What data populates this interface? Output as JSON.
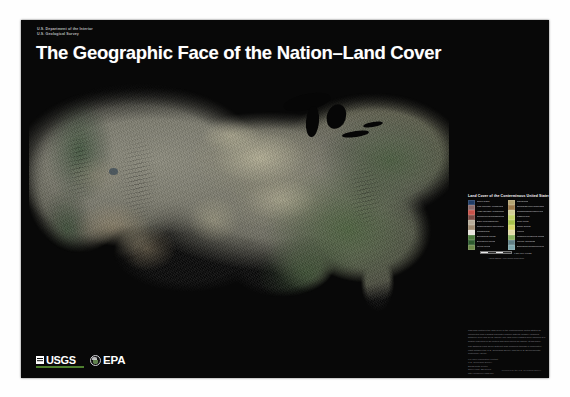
{
  "poster": {
    "agency_line_1": "U.S. Department of the Interior",
    "agency_line_2": "U.S. Geological Survey",
    "title": "The Geographic Face of the Nation–Land Cover",
    "background_color": "#080808",
    "title_color": "#ffffff",
    "credit": "Produced by the U.S. Geological Survey"
  },
  "map": {
    "name": "land-cover-map-contiguous-united-states",
    "description": "Satellite-derived land cover raster of the contiguous United States rendered on a black background",
    "features": [
      "great-lake-superior",
      "great-lake-michigan",
      "great-lake-huron",
      "great-lake-erie",
      "great-lake-ontario",
      "great-salt-lake"
    ]
  },
  "legend": {
    "title": "Land Cover of the Conterminous United States, 1992",
    "column_left": [
      {
        "label": "Open water",
        "color": "#1f3c66"
      },
      {
        "label": "Low intensity residential",
        "color": "#8a6a6a"
      },
      {
        "label": "High intensity residential",
        "color": "#c8524a"
      },
      {
        "label": "Commercial/industrial/transportation",
        "color": "#7a4a44"
      },
      {
        "label": "Bare rock/sand/clay",
        "color": "#b8ad9a"
      },
      {
        "label": "Quarries/strip mines/gravel pits",
        "color": "#a08c72"
      },
      {
        "label": "Transitional",
        "color": "#e8e4dc"
      },
      {
        "label": "Deciduous forest",
        "color": "#4c7a3c"
      },
      {
        "label": "Evergreen forest",
        "color": "#2d5a2d"
      },
      {
        "label": "Mixed forest",
        "color": "#6e8a4a"
      }
    ],
    "column_right": [
      {
        "label": "Shrubland",
        "color": "#b5a472"
      },
      {
        "label": "Orchards/vineyards/other",
        "color": "#9c7a4a"
      },
      {
        "label": "Grasslands/herbaceous",
        "color": "#d2cf96"
      },
      {
        "label": "Pasture/hay",
        "color": "#c4d36a"
      },
      {
        "label": "Row crops",
        "color": "#a8c24a"
      },
      {
        "label": "Small grains",
        "color": "#d8d86a"
      },
      {
        "label": "Fallow",
        "color": "#e2dca8"
      },
      {
        "label": "Urban/recreational grasses",
        "color": "#88b060"
      },
      {
        "label": "Woody wetlands",
        "color": "#5f7f86"
      },
      {
        "label": "Emergent herbaceous wetlands",
        "color": "#7fa8ae"
      }
    ],
    "footnote": "Albers Equal-Area Conic Projection",
    "scale_text": "0        250        500 MILES"
  },
  "description": {
    "paragraph_1": "This map portrays the land cover of the conterminous United States as interpreted from Landsat Thematic Mapper satellite imagery acquired between 1990 and 1993. Twenty-one land cover classes were mapped at a spatial resolution of 30 meters and generalized for display at this scale.",
    "paragraph_2": "The National Land Cover Data set was produced through a cooperative effort between the U.S. Geological Survey and the U.S. Environmental Protection Agency.",
    "contact_heading": "For more information contact:",
    "contact_line_1": "U.S. Geological Survey",
    "contact_line_2": "EROS Data Center",
    "contact_line_3": "Sioux Falls, SD 57198",
    "contact_line_4": "http://landcover.usgs.gov"
  },
  "logos": {
    "usgs_text": "USGS",
    "usgs_accent_color": "#4e7f2e",
    "epa_text": "EPA"
  }
}
